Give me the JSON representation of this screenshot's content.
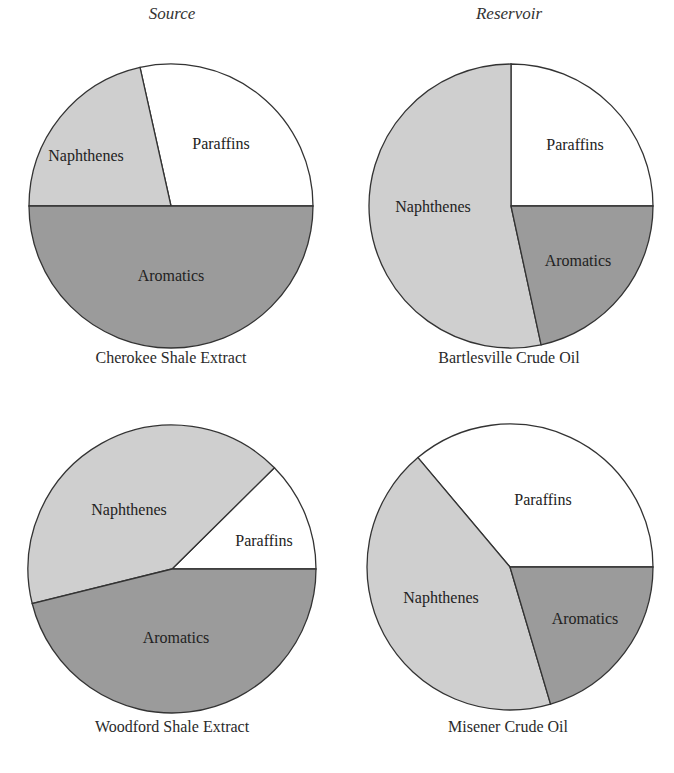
{
  "headers": {
    "left": "Source",
    "right": "Reservoir"
  },
  "colors": {
    "Paraffins": "#ffffff",
    "Naphthenes": "#cfcfcf",
    "Aromatics": "#9b9b9b",
    "stroke": "#333333"
  },
  "chart_data": [
    {
      "type": "pie",
      "title": "Cherokee Shale Extract",
      "group": "Source",
      "categories": [
        "Paraffins",
        "Naphthenes",
        "Aromatics"
      ],
      "values": [
        28.5,
        21.5,
        50.0
      ],
      "start_angle_deg": 0,
      "direction": "counterclockwise",
      "label_positions": [
        [
          221,
          145
        ],
        [
          86,
          157
        ],
        [
          171,
          277
        ]
      ]
    },
    {
      "type": "pie",
      "title": "Bartlesville Crude Oil",
      "group": "Reservoir",
      "categories": [
        "Paraffins",
        "Naphthenes",
        "Aromatics"
      ],
      "values": [
        25.0,
        53.4,
        21.6
      ],
      "start_angle_deg": 0,
      "direction": "counterclockwise",
      "label_positions": [
        [
          575,
          146
        ],
        [
          433,
          208
        ],
        [
          578,
          262
        ]
      ]
    },
    {
      "type": "pie",
      "title": "Woodford Shale Extract",
      "group": "Source",
      "categories": [
        "Paraffins",
        "Naphthenes",
        "Aromatics"
      ],
      "values": [
        12.4,
        41.4,
        46.1
      ],
      "start_angle_deg": 0,
      "direction": "counterclockwise",
      "label_positions": [
        [
          264,
          542
        ],
        [
          129,
          511
        ],
        [
          176,
          639
        ]
      ]
    },
    {
      "type": "pie",
      "title": "Misener Crude Oil",
      "group": "Reservoir",
      "categories": [
        "Paraffins",
        "Naphthenes",
        "Aromatics"
      ],
      "values": [
        36.1,
        43.4,
        20.4
      ],
      "start_angle_deg": 0,
      "direction": "counterclockwise",
      "label_positions": [
        [
          543,
          501
        ],
        [
          441,
          599
        ],
        [
          585,
          620
        ]
      ]
    }
  ],
  "layout": [
    {
      "cx": 171,
      "cy": 206,
      "r": 142,
      "caption_x": 171,
      "caption_y": 359
    },
    {
      "cx": 511,
      "cy": 206,
      "r": 142,
      "caption_x": 509,
      "caption_y": 359
    },
    {
      "cx": 172,
      "cy": 569,
      "r": 144,
      "caption_x": 172,
      "caption_y": 728
    },
    {
      "cx": 510,
      "cy": 567,
      "r": 143,
      "caption_x": 508,
      "caption_y": 728
    }
  ]
}
